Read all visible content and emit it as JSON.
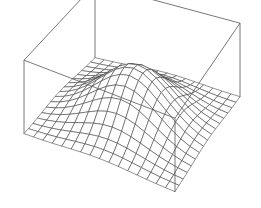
{
  "chart_data": {
    "type": "surface",
    "title": "",
    "xlabel": "",
    "ylabel": "",
    "zlabel": "",
    "function": "z = exp(-(x^2 + y^2) / (2 * sigma^2))",
    "sigma": 0.45,
    "x_range": [
      -1,
      1
    ],
    "y_range": [
      -1,
      1
    ],
    "z_range": [
      0,
      1
    ],
    "grid_lines_per_axis": 17,
    "axes_box": true,
    "ticks": false,
    "grid": false,
    "legend": "none",
    "colors": {
      "background": "#ffffff",
      "mesh": "#333333",
      "box": "#555555"
    }
  }
}
